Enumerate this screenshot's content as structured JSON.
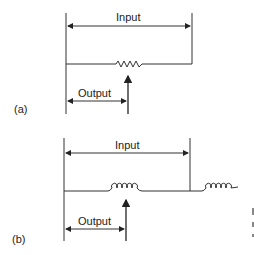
{
  "figure": {
    "parts": [
      {
        "tag": "(a)",
        "element": "resistor",
        "input_label": "Input",
        "output_label": "Output"
      },
      {
        "tag": "(b)",
        "element": "inductor-coil",
        "input_label": "Input",
        "output_label": "Output"
      }
    ],
    "colors": {
      "line": "#333333",
      "background": "#ffffff"
    }
  }
}
